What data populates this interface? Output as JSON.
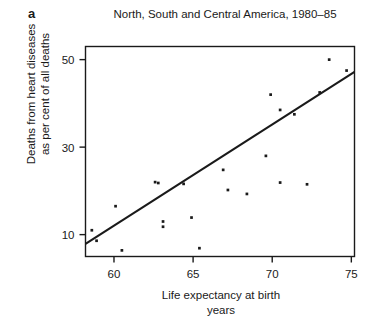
{
  "panel": {
    "letter": "a"
  },
  "chart_data": {
    "type": "scatter",
    "title": "North, South and Central America, 1980–85",
    "subtitle": "",
    "xlabel": "Life expectancy at birth",
    "xlabel_line2": "years",
    "ylabel": "Deaths from heart diseases",
    "ylabel_line2": "as per cent of all deaths",
    "xlim": [
      58.2,
      75.2
    ],
    "ylim": [
      5.0,
      53.0
    ],
    "xticks": [
      60,
      65,
      70,
      75
    ],
    "xtick_labels": [
      "60",
      "65",
      "70",
      "75"
    ],
    "yticks": [
      10,
      30,
      50
    ],
    "ytick_labels": [
      "10",
      "30",
      "50"
    ],
    "grid": false,
    "legend": "none",
    "frame": "box",
    "marker": "square",
    "marker_color": "#1a1a1a",
    "line_color": "#1a1a1a",
    "points": [
      {
        "x": 58.6,
        "y": 11.0
      },
      {
        "x": 58.9,
        "y": 8.6
      },
      {
        "x": 60.1,
        "y": 16.5
      },
      {
        "x": 60.5,
        "y": 6.4
      },
      {
        "x": 62.6,
        "y": 22.0
      },
      {
        "x": 62.8,
        "y": 21.8
      },
      {
        "x": 63.1,
        "y": 13.0
      },
      {
        "x": 63.1,
        "y": 11.8
      },
      {
        "x": 64.4,
        "y": 21.6
      },
      {
        "x": 64.9,
        "y": 13.9
      },
      {
        "x": 65.4,
        "y": 6.9
      },
      {
        "x": 66.9,
        "y": 24.8
      },
      {
        "x": 67.2,
        "y": 20.2
      },
      {
        "x": 68.4,
        "y": 19.3
      },
      {
        "x": 69.6,
        "y": 28.0
      },
      {
        "x": 69.9,
        "y": 42.0
      },
      {
        "x": 70.5,
        "y": 38.5
      },
      {
        "x": 70.5,
        "y": 21.9
      },
      {
        "x": 71.4,
        "y": 37.5
      },
      {
        "x": 72.2,
        "y": 21.5
      },
      {
        "x": 73.0,
        "y": 42.5
      },
      {
        "x": 73.6,
        "y": 50.0
      },
      {
        "x": 74.7,
        "y": 47.5
      }
    ],
    "trend_line": {
      "label": "fitted regression line",
      "x0": 58.2,
      "y0": 7.9,
      "x1": 75.2,
      "y1": 47.2
    }
  }
}
